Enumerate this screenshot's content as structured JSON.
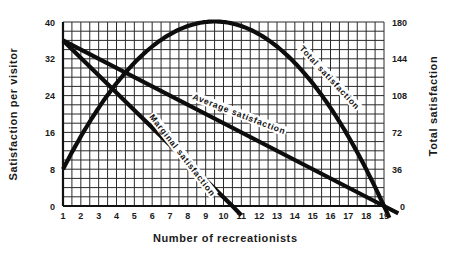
{
  "chart_data": {
    "type": "line",
    "title": "",
    "xlabel": "Number of recreationists",
    "ylabel": "Satisfaction per visitor",
    "y2label": "Total satisfaction",
    "x_ticks": [
      1,
      2,
      3,
      4,
      5,
      6,
      7,
      8,
      9,
      10,
      11,
      12,
      13,
      14,
      15,
      16,
      17,
      18,
      19
    ],
    "y_ticks": [
      0,
      8,
      16,
      24,
      32,
      40
    ],
    "y2_ticks": [
      0,
      36,
      72,
      108,
      144,
      180
    ],
    "xlim": [
      1,
      19
    ],
    "ylim": [
      0,
      40
    ],
    "y2lim": [
      0,
      180
    ],
    "grid": true,
    "legend": "inline curve labels",
    "series": [
      {
        "name": "Total satisfaction",
        "axis": "right",
        "x": [
          1,
          2,
          3,
          4,
          5,
          6,
          7,
          8,
          9,
          9.5,
          10,
          11,
          12,
          13,
          14,
          15,
          16,
          17,
          18,
          19,
          19.3
        ],
        "values": [
          36,
          68,
          96,
          120,
          140,
          156,
          168,
          176,
          180,
          180.5,
          180,
          176,
          168,
          156,
          140,
          120,
          96,
          68,
          36,
          0,
          -12
        ]
      },
      {
        "name": "Average satisfaction",
        "axis": "left",
        "x": [
          1,
          19,
          19.8
        ],
        "values": [
          36,
          0,
          -1.6
        ]
      },
      {
        "name": "Marginal satisfaction",
        "axis": "left",
        "x": [
          1,
          10.5,
          11
        ],
        "values": [
          36,
          0,
          -2
        ]
      }
    ]
  },
  "labels": {
    "y_axis_title": "Satisfaction per visitor",
    "y2_axis_title": "Total satisfaction",
    "x_axis_title": "Number of recreationists",
    "curve_total": "Total satisfaction",
    "curve_average": "Average satisfaction",
    "curve_marginal": "Marginal satisfaction"
  }
}
